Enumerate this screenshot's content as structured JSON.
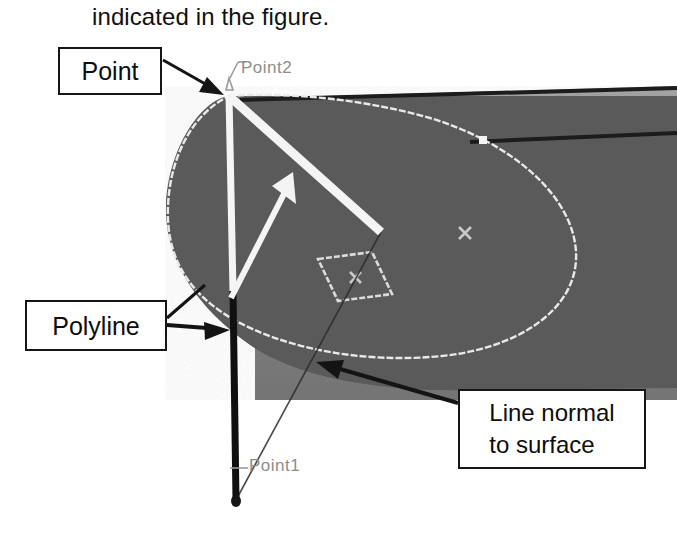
{
  "caption": {
    "text": "indicated in the figure."
  },
  "callouts": [
    {
      "id": "point",
      "label": "Point"
    },
    {
      "id": "polyline",
      "label": "Polyline"
    },
    {
      "id": "normal",
      "label": "Line  normal\nto surface"
    }
  ],
  "cad_tags": [
    {
      "id": "point2",
      "label": "Point2"
    },
    {
      "id": "point1",
      "label": "Point1"
    }
  ],
  "colors": {
    "background": "#ffffff",
    "surface_dark": "#5a5a5a",
    "surface_light": "#9a9a9a",
    "surface_mid": "#8a8a8a",
    "edge_white": "#e8e8e8",
    "edge_black": "#1b1b1b",
    "callout_border": "#161616",
    "callout_text": "#0d0d0d",
    "cad_tag_text": "#8d8d8d",
    "polyline_upper": "#f2f2f2",
    "polyline_lower": "#101010",
    "normal_arrow": "#f4f4f4"
  },
  "geometry": {
    "point2": {
      "x": 229,
      "y": 96
    },
    "point1": {
      "x": 236,
      "y": 502
    },
    "normal_line": {
      "x1": 229,
      "y1": 96,
      "x2": 381,
      "y2": 232
    },
    "normal_arrow_head": {
      "x": 292,
      "y": 178
    },
    "polyline_split_y": 291,
    "ellipse_cx": 368,
    "ellipse_cy": 240,
    "marker_cross_1": {
      "x": 465,
      "y": 233
    },
    "marker_cross_2": {
      "x": 355,
      "y": 277
    },
    "marker_square": {
      "x": 483,
      "y": 140
    }
  }
}
